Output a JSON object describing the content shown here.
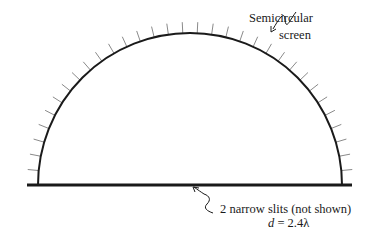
{
  "labels": {
    "screen_line1": "Semicircular",
    "screen_line2": "screen",
    "slits_line1": "2 narrow slits (not shown)",
    "slits_var": "d",
    "slits_eq": " = 2.4λ"
  },
  "geometry": {
    "center_x": 190,
    "center_y": 185,
    "radius": 152,
    "baseline_x1": 27,
    "baseline_x2": 352,
    "tick_count": 33,
    "tick_length": 11
  },
  "colors": {
    "line": "#1a1a1a",
    "tick": "#8a8a8a"
  }
}
